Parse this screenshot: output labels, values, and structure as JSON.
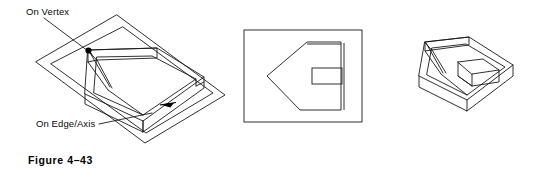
{
  "figure": {
    "caption": "Figure 4–43",
    "background_color": "#ffffff",
    "line_color": "#1a1a1a",
    "marker_color": "#000000"
  },
  "callouts": [
    {
      "id": "on-vertex",
      "label": "On Vertex",
      "marker": "filled-dot",
      "leader_from": [
        78,
        18
      ],
      "leader_to": [
        88,
        50
      ]
    },
    {
      "id": "on-edge-axis",
      "label": "On Edge/Axis",
      "marker": "arrowhead",
      "leader_from": [
        98,
        124
      ],
      "leader_to": [
        150,
        112
      ]
    }
  ],
  "views": [
    {
      "id": "view-sketch-plane",
      "name": "isometric-part-on-sketch-plane",
      "description": "Tray shaped part shown in isometric with a transparent sketch plane parallelogram beneath it"
    },
    {
      "id": "view-plan",
      "name": "plan-view-in-border",
      "description": "Rectangular drawing border enclosing a pentagon profile with an inner rectangle"
    },
    {
      "id": "view-isometric",
      "name": "isometric-part",
      "description": "Tray shaped part shown in isometric with a raised rectangular boss inside"
    }
  ],
  "geometry": {
    "sketch_plane": "117,15 225,95 145,143 36,62",
    "plane_inner": "122,26 214,94 146,134 50,63",
    "tray_outer_top": "88,50 157,48 204,77 143,121 85,94",
    "tray_bottom_front": "143,132 204,88",
    "plan_border": "244,30 362,30 362,122 244,122",
    "plan_profile": "307,42 166,57",
    "plan_inner_rect": "312,68 342,68 342,84 312,84",
    "iso_top_face": "424,42 470,37 506,63 470,97 419,77",
    "iso_boss": "455,65 487,61 502,74 470,80"
  }
}
